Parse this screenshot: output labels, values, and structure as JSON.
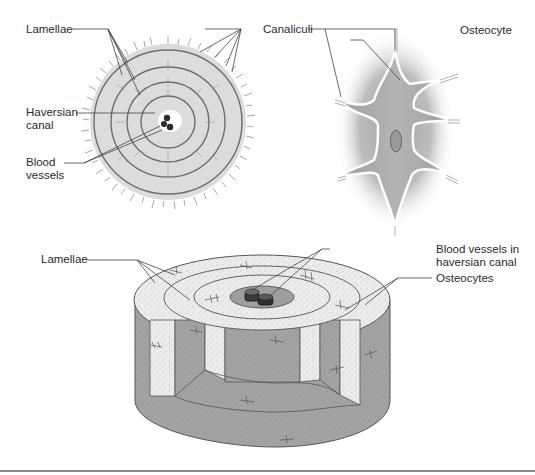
{
  "figure": {
    "panels": [
      {
        "id": "cross-section",
        "description": "Cross-section of an osteon"
      },
      {
        "id": "osteocyte-detail",
        "description": "Osteocyte within lacuna with canaliculi"
      },
      {
        "id": "3d-osteon",
        "description": "Three-dimensional cutaway of an osteon"
      }
    ]
  },
  "labels": {
    "top_left": {
      "lamellae": "Lamellae",
      "haversian_canal_1": "Haversian",
      "haversian_canal_2": "canal",
      "blood_vessels_1": "Blood",
      "blood_vessels_2": "vessels"
    },
    "top_right": {
      "canaliculi": "Canaliculi",
      "osteocyte": "Osteocyte"
    },
    "bottom": {
      "lamellae": "Lamellae",
      "blood_vessels_1": "Blood vessels in",
      "blood_vessels_2": "haversian canal",
      "osteocytes": "Osteocytes"
    }
  },
  "colors": {
    "bone_light": "#e6e6e6",
    "bone_dark": "#9c9c9c",
    "cell_grey": "#a8a8a8",
    "line": "#444444",
    "rule": "#8a8a8a"
  }
}
